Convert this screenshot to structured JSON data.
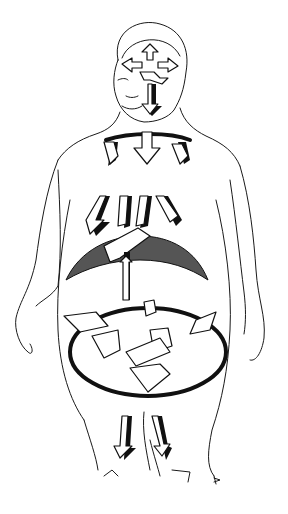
{
  "illustration": {
    "subject": "line drawing of human figure with arrows",
    "background_color": "#ffffff",
    "ink_color": "#111111",
    "shade_color": "#555555",
    "regions": [
      {
        "name": "head",
        "arrows": 5
      },
      {
        "name": "neck-shoulders",
        "arrows": 3
      },
      {
        "name": "chest-diaphragm",
        "arrows": 4
      },
      {
        "name": "abdomen-ring",
        "arrows": 6
      },
      {
        "name": "legs",
        "arrows": 2
      }
    ],
    "signature": "R"
  }
}
